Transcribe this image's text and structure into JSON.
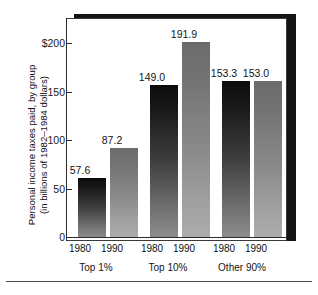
{
  "chart_data": {
    "type": "bar",
    "title": "",
    "subtitle": "",
    "xlabel": "",
    "ylabel_line1": "Personal income taxes paid, by group",
    "ylabel_line2": "(in billions of 1982–1984 dollars)",
    "ylim": [
      0,
      215
    ],
    "yticks": [
      0,
      50,
      100,
      150,
      200
    ],
    "ytick_labels": [
      "0",
      "50",
      "100",
      "150",
      "$200"
    ],
    "grid": false,
    "legend": "none",
    "categories": [
      "Top 1%",
      "Top 10%",
      "Other 90%"
    ],
    "series": [
      {
        "name": "1980",
        "values": [
          57.6,
          149.0,
          153.3
        ]
      },
      {
        "name": "1990",
        "values": [
          87.2,
          191.9,
          153.0
        ]
      }
    ],
    "bars": [
      {
        "group": "Top 1%",
        "year": "1980",
        "value": 57.6,
        "label": "57.6"
      },
      {
        "group": "Top 1%",
        "year": "1990",
        "value": 87.2,
        "label": "87.2"
      },
      {
        "group": "Top 10%",
        "year": "1980",
        "value": 149.0,
        "label": "149.0"
      },
      {
        "group": "Top 10%",
        "year": "1990",
        "value": 191.9,
        "label": "191.9"
      },
      {
        "group": "Other 90%",
        "year": "1980",
        "value": 153.3,
        "label": "153.3"
      },
      {
        "group": "Other 90%",
        "year": "1990",
        "value": 153.0,
        "label": "153.0"
      }
    ],
    "colors": {
      "bar_1980_top": "#0b0b0b",
      "bar_1980_bottom": "#8c8c8c",
      "bar_1990_top": "#6b6b6b",
      "bar_1990_bottom": "#adadad",
      "axis": "#2b2b2b",
      "frame_shadow": "#141414",
      "panel": "#ffffff",
      "text": "#141414"
    }
  }
}
